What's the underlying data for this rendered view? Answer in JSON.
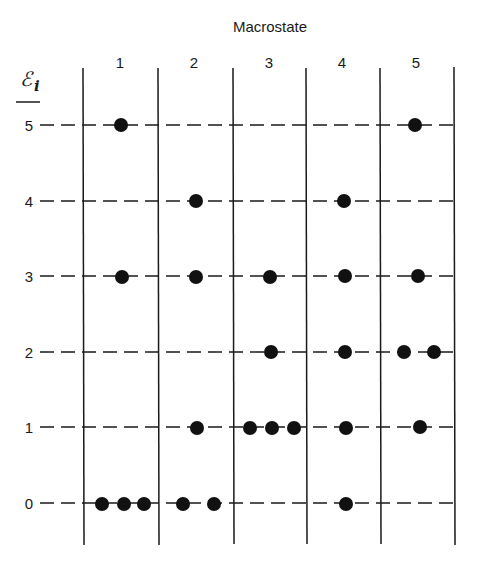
{
  "diagram": {
    "title": "Macrostate",
    "energy_symbol": "ℰ",
    "energy_subscript": "i",
    "columns": [
      "1",
      "2",
      "3",
      "4",
      "5"
    ],
    "levels": [
      "5",
      "4",
      "3",
      "2",
      "1",
      "0"
    ],
    "occupancy": {
      "macrostate_1": {
        "level_5": 1,
        "level_4": 0,
        "level_3": 1,
        "level_2": 0,
        "level_1": 0,
        "level_0": 3
      },
      "macrostate_2": {
        "level_5": 0,
        "level_4": 1,
        "level_3": 1,
        "level_2": 0,
        "level_1": 1,
        "level_0": 2
      },
      "macrostate_3": {
        "level_5": 0,
        "level_4": 0,
        "level_3": 1,
        "level_2": 1,
        "level_1": 3,
        "level_0": 0
      },
      "macrostate_4": {
        "level_5": 0,
        "level_4": 1,
        "level_3": 1,
        "level_2": 1,
        "level_1": 1,
        "level_0": 1
      },
      "macrostate_5": {
        "level_5": 1,
        "level_4": 0,
        "level_3": 1,
        "level_2": 2,
        "level_1": 1,
        "level_0": 0
      }
    },
    "colors": {
      "ink": "#1a1a1a",
      "background": "#ffffff"
    }
  }
}
